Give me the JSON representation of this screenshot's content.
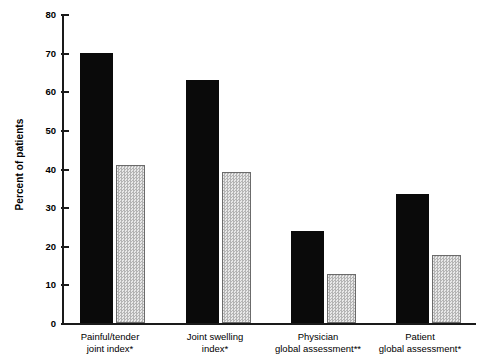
{
  "chart_data": {
    "type": "bar",
    "title": "",
    "xlabel": "",
    "ylabel": "Percent of patients",
    "ylim": [
      0,
      80
    ],
    "yticks": [
      0,
      10,
      20,
      30,
      40,
      50,
      60,
      70,
      80
    ],
    "ytick_labels": [
      "0",
      "10",
      "20",
      "30",
      "40",
      "50",
      "60",
      "70",
      "80"
    ],
    "grid": false,
    "legend": "none",
    "categories": [
      "Painful/tender\njoint index*",
      "Joint swelling\nindex*",
      "Physician\nglobal assessment**",
      "Patient\nglobal assessment*"
    ],
    "series": [
      {
        "name": "series-1-solid-black",
        "values": [
          70,
          63,
          23.7,
          33.5
        ]
      },
      {
        "name": "series-2-hatched-gray",
        "values": [
          41,
          39,
          12.7,
          17.7
        ]
      }
    ],
    "colors": {
      "series_1": "#0a0a0a",
      "series_2_fill": "#dcdcdc",
      "series_2_outline": "#6b6b6b",
      "axis": "#1a1a1a",
      "background": "#ffffff"
    }
  }
}
